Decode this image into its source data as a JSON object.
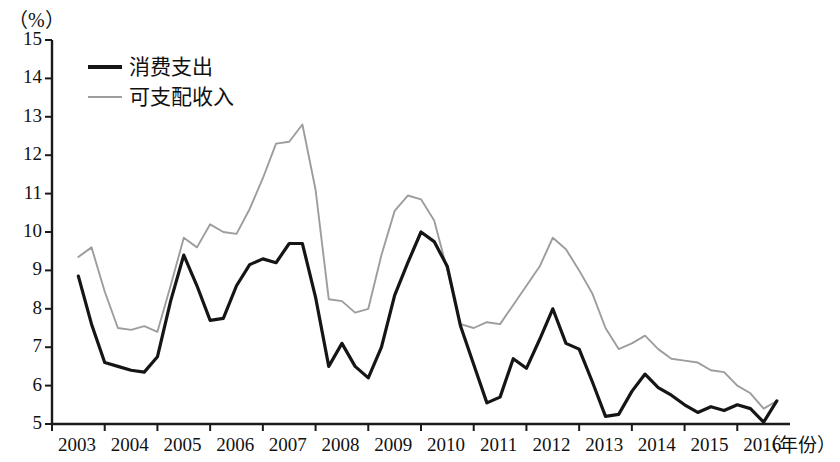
{
  "chart_data": {
    "type": "line",
    "title": "",
    "subtitle": "",
    "unit_label": "（%）",
    "xlabel": "（年份）",
    "ylabel": "",
    "ylim": [
      5,
      15
    ],
    "ytick_labels": [
      "5",
      "6",
      "7",
      "8",
      "9",
      "10",
      "11",
      "12",
      "13",
      "14",
      "15"
    ],
    "ytick_values": [
      5,
      6,
      7,
      8,
      9,
      10,
      11,
      12,
      13,
      14,
      15
    ],
    "xtick_labels": [
      "2003",
      "2004",
      "2005",
      "2006",
      "2007",
      "2008",
      "2009",
      "2010",
      "2011",
      "2012",
      "2013",
      "2014",
      "2015",
      "2016"
    ],
    "xtick_values": [
      2003,
      2004,
      2005,
      2006,
      2007,
      2008,
      2009,
      2010,
      2011,
      2012,
      2013,
      2014,
      2015,
      2016
    ],
    "xlim": [
      2003,
      2017
    ],
    "grid": false,
    "legend_position": "top-left",
    "x": [
      2003.5,
      2003.75,
      2004.0,
      2004.25,
      2004.5,
      2004.75,
      2005.0,
      2005.25,
      2005.5,
      2005.75,
      2006.0,
      2006.25,
      2006.5,
      2006.75,
      2007.0,
      2007.25,
      2007.5,
      2007.75,
      2008.0,
      2008.25,
      2008.5,
      2008.75,
      2009.0,
      2009.25,
      2009.5,
      2009.75,
      2010.0,
      2010.25,
      2010.5,
      2010.75,
      2011.0,
      2011.25,
      2011.5,
      2011.75,
      2012.0,
      2012.25,
      2012.5,
      2012.75,
      2013.0,
      2013.25,
      2013.5,
      2013.75,
      2014.0,
      2014.25,
      2014.5,
      2014.75,
      2015.0,
      2015.25,
      2015.5,
      2015.75,
      2016.0,
      2016.25,
      2016.5,
      2016.75
    ],
    "series": [
      {
        "name": "消费支出",
        "color": "#151515",
        "width": 3.2,
        "values": [
          8.85,
          7.6,
          6.6,
          6.5,
          6.4,
          6.35,
          6.75,
          8.2,
          9.4,
          8.6,
          7.7,
          7.75,
          8.6,
          9.15,
          9.3,
          9.2,
          9.7,
          9.7,
          8.3,
          6.5,
          7.1,
          6.5,
          6.2,
          7.0,
          8.35,
          9.2,
          10.0,
          9.75,
          9.1,
          7.55,
          6.55,
          5.55,
          5.7,
          6.7,
          6.45,
          7.2,
          8.0,
          7.1,
          6.95,
          6.1,
          5.2,
          5.25,
          5.85,
          6.3,
          5.95,
          5.75,
          5.5,
          5.3,
          5.45,
          5.35,
          5.5,
          5.4,
          5.05,
          5.6
        ]
      },
      {
        "name": "可支配收入",
        "color": "#9d9d9d",
        "width": 1.9,
        "values": [
          9.35,
          9.6,
          8.45,
          7.5,
          7.45,
          7.55,
          7.4,
          8.6,
          9.85,
          9.6,
          10.2,
          10.0,
          9.95,
          10.6,
          11.4,
          12.3,
          12.35,
          12.8,
          11.1,
          8.25,
          8.2,
          7.9,
          8.0,
          9.4,
          10.55,
          10.95,
          10.85,
          10.3,
          9.0,
          7.6,
          7.5,
          7.65,
          7.6,
          8.1,
          8.6,
          9.1,
          9.85,
          9.55,
          9.0,
          8.4,
          7.5,
          6.95,
          7.1,
          7.3,
          6.95,
          6.7,
          6.65,
          6.6,
          6.4,
          6.35,
          6.0,
          5.8,
          5.4,
          5.6
        ]
      }
    ]
  },
  "legend": {
    "items": [
      {
        "label": "消费支出"
      },
      {
        "label": "可支配收入"
      }
    ]
  },
  "axes": {
    "unit": "（%）",
    "x_title": "（年份）"
  }
}
